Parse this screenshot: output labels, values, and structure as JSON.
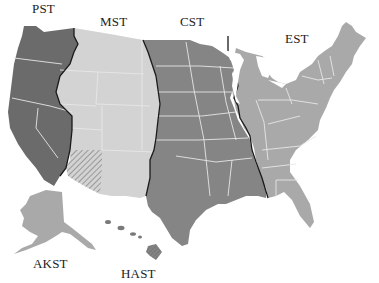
{
  "map": {
    "title": "United States Time Zones",
    "zones": [
      {
        "id": "pst",
        "label": "PST",
        "color": "#6b6b6b"
      },
      {
        "id": "mst",
        "label": "MST",
        "color": "#d3d3d3"
      },
      {
        "id": "cst",
        "label": "CST",
        "color": "#858585"
      },
      {
        "id": "est",
        "label": "EST",
        "color": "#a9a9a9"
      },
      {
        "id": "akst",
        "label": "AKST",
        "color": "#a9a9a9"
      },
      {
        "id": "hast",
        "label": "HAST",
        "color": "#7a7a7a"
      }
    ],
    "boundary_color": "#1a1a1a",
    "state_line_color": "#e6e6e6",
    "hatched_region": "Arizona (no daylight saving time)"
  }
}
